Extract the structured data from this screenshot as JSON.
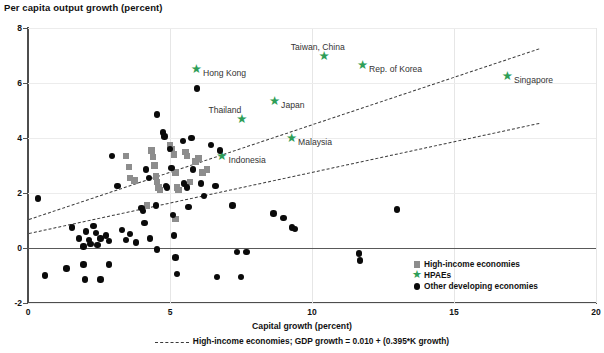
{
  "chart_data": {
    "type": "scatter",
    "title": "Per capita output growth (percent)",
    "xlabel": "Capital growth (percent)",
    "ylabel": "Per capita output growth (percent)",
    "xlim": [
      0,
      20
    ],
    "ylim": [
      -2,
      8
    ],
    "xticks": [
      0,
      5,
      10,
      15,
      20
    ],
    "yticks": [
      -2,
      0,
      2,
      4,
      6,
      8
    ],
    "grid": true,
    "legend_position": "bottom-right",
    "colors": {
      "high_income": "#8d8d8d",
      "hpae": "#2e9e57",
      "other_developing": "#0a0a0a",
      "trendline": "#3a3a3a",
      "axis": "#4d4d4d",
      "gridline": "#e6e6e6"
    },
    "legend": [
      {
        "label": "High-income economies",
        "marker": "square",
        "color": "#8d8d8d"
      },
      {
        "label": "HPAEs",
        "marker": "star",
        "color": "#2e9e57"
      },
      {
        "label": "Other developing economies",
        "marker": "circle",
        "color": "#0a0a0a"
      }
    ],
    "annotation": "High-income economies; GDP growth = 0.010 + (0.395*K growth)",
    "trendlines": [
      {
        "name": "high-income",
        "style": "dash-dot",
        "x": [
          0.05,
          18.0
        ],
        "y": [
          1.05,
          7.25
        ]
      },
      {
        "name": "other-developing",
        "style": "dashed",
        "x": [
          0.05,
          18.0
        ],
        "y": [
          0.55,
          4.55
        ]
      }
    ],
    "series": [
      {
        "name": "HPAEs",
        "marker": "star",
        "color": "#2e9e57",
        "points": [
          {
            "label": "Hong Kong",
            "x": 5.95,
            "y": 6.35,
            "label_side": "right"
          },
          {
            "label": "Taiwan, China",
            "x": 10.45,
            "y": 6.85,
            "label_side": "above"
          },
          {
            "label": "Rep. of Korea",
            "x": 11.8,
            "y": 6.5,
            "label_side": "right"
          },
          {
            "label": "Singapore",
            "x": 16.9,
            "y": 6.1,
            "label_side": "right"
          },
          {
            "label": "Japan",
            "x": 8.7,
            "y": 5.2,
            "label_side": "right"
          },
          {
            "label": "Thailand",
            "x": 7.55,
            "y": 4.55,
            "label_side": "above"
          },
          {
            "label": "Malaysia",
            "x": 9.3,
            "y": 3.85,
            "label_side": "right"
          },
          {
            "label": "Indonesia",
            "x": 6.85,
            "y": 3.2,
            "label_side": "right"
          }
        ]
      },
      {
        "name": "High-income economies",
        "marker": "square",
        "color": "#8d8d8d",
        "points": [
          {
            "x": 3.45,
            "y": 3.35
          },
          {
            "x": 3.55,
            "y": 2.95
          },
          {
            "x": 3.6,
            "y": 2.55
          },
          {
            "x": 3.75,
            "y": 2.45
          },
          {
            "x": 4.35,
            "y": 3.55
          },
          {
            "x": 4.4,
            "y": 3.3
          },
          {
            "x": 4.45,
            "y": 3.0
          },
          {
            "x": 4.5,
            "y": 2.6
          },
          {
            "x": 4.55,
            "y": 2.4
          },
          {
            "x": 4.6,
            "y": 2.2
          },
          {
            "x": 4.65,
            "y": 2.1
          },
          {
            "x": 5.0,
            "y": 3.75
          },
          {
            "x": 5.05,
            "y": 3.6
          },
          {
            "x": 5.15,
            "y": 3.4
          },
          {
            "x": 5.2,
            "y": 2.75
          },
          {
            "x": 5.25,
            "y": 2.2
          },
          {
            "x": 5.3,
            "y": 2.1
          },
          {
            "x": 5.55,
            "y": 3.5
          },
          {
            "x": 5.6,
            "y": 3.35
          },
          {
            "x": 5.7,
            "y": 2.4
          },
          {
            "x": 5.9,
            "y": 3.15
          },
          {
            "x": 6.0,
            "y": 3.25
          },
          {
            "x": 6.15,
            "y": 2.75
          },
          {
            "x": 4.2,
            "y": 1.55
          },
          {
            "x": 5.2,
            "y": 1.05
          },
          {
            "x": 6.3,
            "y": 2.85
          }
        ]
      },
      {
        "name": "Other developing economies",
        "marker": "circle",
        "color": "#0a0a0a",
        "points": [
          {
            "x": 0.35,
            "y": 1.8
          },
          {
            "x": 1.55,
            "y": 0.75
          },
          {
            "x": 1.8,
            "y": 0.35
          },
          {
            "x": 1.95,
            "y": 0.05
          },
          {
            "x": 2.05,
            "y": 0.6
          },
          {
            "x": 2.15,
            "y": 0.3
          },
          {
            "x": 2.2,
            "y": 0.15
          },
          {
            "x": 2.3,
            "y": 0.8
          },
          {
            "x": 2.4,
            "y": 0.55
          },
          {
            "x": 2.45,
            "y": 0.1
          },
          {
            "x": 2.55,
            "y": 0.35
          },
          {
            "x": 2.75,
            "y": 0.45
          },
          {
            "x": 2.85,
            "y": 0.25
          },
          {
            "x": 2.95,
            "y": 3.35
          },
          {
            "x": 3.15,
            "y": 2.25
          },
          {
            "x": 3.3,
            "y": 0.65
          },
          {
            "x": 3.45,
            "y": 0.3
          },
          {
            "x": 3.6,
            "y": 0.5
          },
          {
            "x": 3.8,
            "y": 0.2
          },
          {
            "x": 4.0,
            "y": 1.45
          },
          {
            "x": 4.05,
            "y": 1.35
          },
          {
            "x": 4.1,
            "y": 0.9
          },
          {
            "x": 4.15,
            "y": 2.85
          },
          {
            "x": 4.25,
            "y": 2.55
          },
          {
            "x": 4.3,
            "y": 0.35
          },
          {
            "x": 4.5,
            "y": 1.55
          },
          {
            "x": 4.55,
            "y": 4.85
          },
          {
            "x": 4.75,
            "y": 4.2
          },
          {
            "x": 4.8,
            "y": 4.05
          },
          {
            "x": 4.85,
            "y": 2.25
          },
          {
            "x": 4.9,
            "y": 2.2
          },
          {
            "x": 5.0,
            "y": 3.6
          },
          {
            "x": 5.05,
            "y": 2.9
          },
          {
            "x": 5.1,
            "y": 1.2
          },
          {
            "x": 5.15,
            "y": 0.45
          },
          {
            "x": 5.2,
            "y": -0.35
          },
          {
            "x": 5.25,
            "y": -0.95
          },
          {
            "x": 5.45,
            "y": 3.9
          },
          {
            "x": 5.5,
            "y": 2.35
          },
          {
            "x": 5.6,
            "y": 2.2
          },
          {
            "x": 5.65,
            "y": 1.5
          },
          {
            "x": 5.75,
            "y": 4.0
          },
          {
            "x": 5.8,
            "y": 2.85
          },
          {
            "x": 5.95,
            "y": 5.8
          },
          {
            "x": 6.1,
            "y": 2.35
          },
          {
            "x": 6.2,
            "y": 1.9
          },
          {
            "x": 6.45,
            "y": 3.75
          },
          {
            "x": 6.6,
            "y": 2.25
          },
          {
            "x": 6.75,
            "y": 3.55
          },
          {
            "x": 7.2,
            "y": 1.55
          },
          {
            "x": 7.35,
            "y": -0.15
          },
          {
            "x": 7.5,
            "y": -1.05
          },
          {
            "x": 7.7,
            "y": -0.15
          },
          {
            "x": 6.65,
            "y": -1.05
          },
          {
            "x": 8.65,
            "y": 1.25
          },
          {
            "x": 9.0,
            "y": 1.1
          },
          {
            "x": 9.3,
            "y": 0.75
          },
          {
            "x": 9.4,
            "y": 0.7
          },
          {
            "x": 11.65,
            "y": -0.2
          },
          {
            "x": 11.7,
            "y": -0.45
          },
          {
            "x": 13.0,
            "y": 1.4
          },
          {
            "x": 0.6,
            "y": -1.0
          },
          {
            "x": 1.35,
            "y": -0.75
          },
          {
            "x": 1.95,
            "y": -0.6
          },
          {
            "x": 2.0,
            "y": -1.15
          },
          {
            "x": 2.55,
            "y": -1.15
          },
          {
            "x": 4.55,
            "y": -0.05
          },
          {
            "x": 2.85,
            "y": -0.6
          }
        ]
      }
    ]
  }
}
